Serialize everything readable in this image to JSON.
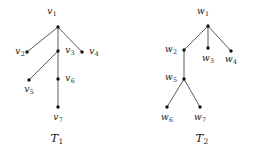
{
  "figure": {
    "background_color": "#ffffff",
    "edge_color": "#4a4a4a",
    "node_color": "#111111",
    "text_color": "#1a1a1a"
  },
  "chart_data": {
    "type": "diagram",
    "subtype": "rooted-tree-graph",
    "title": "",
    "graphs": [
      {
        "id": "T1",
        "caption_base": "T",
        "caption_sub": "1",
        "caption_x": 57,
        "caption_y": 142,
        "root": "v1",
        "nodes": [
          {
            "id": "v1",
            "base": "v",
            "sub": "1",
            "x": 58,
            "y": 27,
            "label_x": 52,
            "label_y": 14,
            "label_anchor": "middle"
          },
          {
            "id": "v2",
            "base": "v",
            "sub": "2",
            "x": 27,
            "y": 52,
            "label_x": 20,
            "label_y": 54,
            "label_anchor": "middle"
          },
          {
            "id": "v3",
            "base": "v",
            "sub": "3",
            "x": 58,
            "y": 51,
            "label_x": 70,
            "label_y": 53,
            "label_anchor": "middle"
          },
          {
            "id": "v4",
            "base": "v",
            "sub": "4",
            "x": 82,
            "y": 52,
            "label_x": 94,
            "label_y": 54,
            "label_anchor": "middle"
          },
          {
            "id": "v5",
            "base": "v",
            "sub": "5",
            "x": 29,
            "y": 80,
            "label_x": 29,
            "label_y": 92,
            "label_anchor": "middle"
          },
          {
            "id": "v6",
            "base": "v",
            "sub": "6",
            "x": 58,
            "y": 79,
            "label_x": 70,
            "label_y": 81,
            "label_anchor": "middle"
          },
          {
            "id": "v7",
            "base": "v",
            "sub": "7",
            "x": 58,
            "y": 107,
            "label_x": 58,
            "label_y": 120,
            "label_anchor": "middle"
          }
        ],
        "edges": [
          {
            "from": "v1",
            "to": "v2"
          },
          {
            "from": "v1",
            "to": "v3"
          },
          {
            "from": "v1",
            "to": "v4"
          },
          {
            "from": "v3",
            "to": "v5"
          },
          {
            "from": "v3",
            "to": "v6"
          },
          {
            "from": "v6",
            "to": "v7"
          }
        ]
      },
      {
        "id": "T2",
        "caption_base": "T",
        "caption_sub": "2",
        "caption_x": 202,
        "caption_y": 142,
        "root": "w1",
        "nodes": [
          {
            "id": "w1",
            "base": "w",
            "sub": "1",
            "x": 208,
            "y": 26,
            "label_x": 203,
            "label_y": 14,
            "label_anchor": "middle"
          },
          {
            "id": "w2",
            "base": "w",
            "sub": "2",
            "x": 184,
            "y": 50,
            "label_x": 171,
            "label_y": 52,
            "label_anchor": "middle"
          },
          {
            "id": "w3",
            "base": "w",
            "sub": "3",
            "x": 208,
            "y": 48,
            "label_x": 208,
            "label_y": 61,
            "label_anchor": "middle"
          },
          {
            "id": "w4",
            "base": "w",
            "sub": "4",
            "x": 231,
            "y": 51,
            "label_x": 231,
            "label_y": 62,
            "label_anchor": "middle"
          },
          {
            "id": "w5",
            "base": "w",
            "sub": "5",
            "x": 184,
            "y": 79,
            "label_x": 171,
            "label_y": 80,
            "label_anchor": "middle"
          },
          {
            "id": "w6",
            "base": "w",
            "sub": "6",
            "x": 167,
            "y": 107,
            "label_x": 167,
            "label_y": 120,
            "label_anchor": "middle"
          },
          {
            "id": "w7",
            "base": "w",
            "sub": "7",
            "x": 200,
            "y": 107,
            "label_x": 200,
            "label_y": 120,
            "label_anchor": "middle"
          }
        ],
        "edges": [
          {
            "from": "w1",
            "to": "w2"
          },
          {
            "from": "w1",
            "to": "w3"
          },
          {
            "from": "w1",
            "to": "w4"
          },
          {
            "from": "w2",
            "to": "w5"
          },
          {
            "from": "w5",
            "to": "w6"
          },
          {
            "from": "w5",
            "to": "w7"
          }
        ]
      }
    ]
  }
}
